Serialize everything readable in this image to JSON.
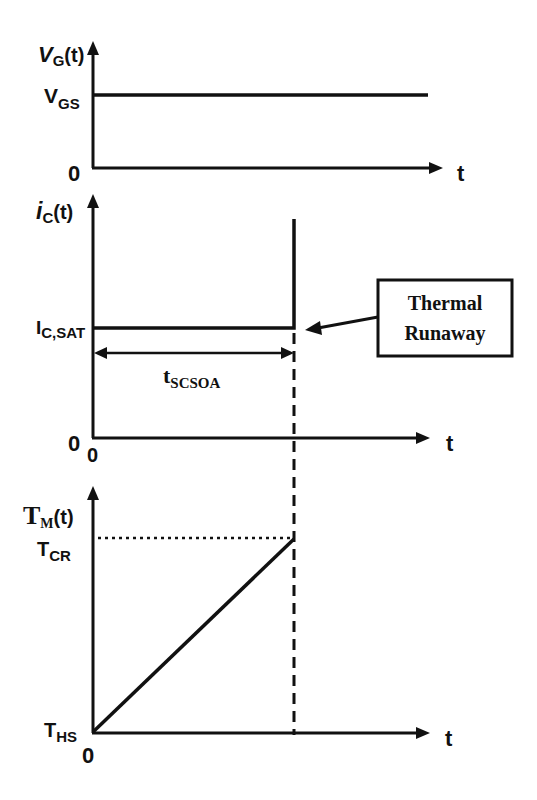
{
  "diagram": {
    "panels": [
      {
        "id": "gate-voltage",
        "ylabel_main": "V",
        "ylabel_sub": "G",
        "ylabel_tail": "(t)",
        "level_label_main": "V",
        "level_label_sub": "GS",
        "zero_label": "0",
        "xlabel": "t"
      },
      {
        "id": "collector-current",
        "ylabel_main": "i",
        "ylabel_sub": "C",
        "ylabel_tail": "(t)",
        "level_label_main": "I",
        "level_label_sub": "C,SAT",
        "duration_main": "t",
        "duration_sub": "SCSOA",
        "zero_label_y": "0",
        "zero_label_x": "0",
        "xlabel": "t"
      },
      {
        "id": "junction-temperature",
        "ylabel_main": "T",
        "ylabel_sub": "M",
        "ylabel_tail": "(t)",
        "top_label_main": "T",
        "top_label_sub": "CR",
        "bottom_label_main": "T",
        "bottom_label_sub": "HS",
        "zero_label_x": "0",
        "xlabel": "t"
      }
    ],
    "callout": {
      "line1": "Thermal",
      "line2": "Runaway"
    },
    "colors": {
      "ink": "#111111",
      "background": "#ffffff"
    }
  }
}
